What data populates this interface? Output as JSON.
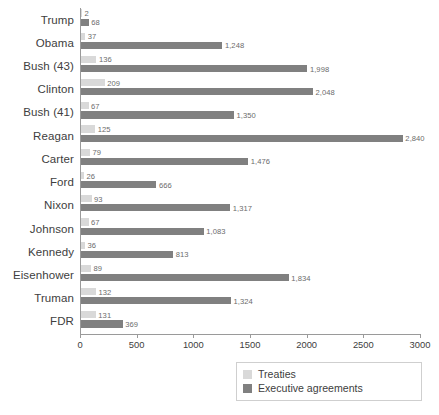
{
  "chart_data": {
    "type": "bar",
    "orientation": "horizontal",
    "title": "",
    "xlabel": "",
    "ylabel": "",
    "xlim": [
      0,
      3000
    ],
    "xticks": [
      0,
      500,
      1000,
      1500,
      2000,
      2500,
      3000
    ],
    "xtick_labels": [
      "0",
      "500",
      "1000",
      "1500",
      "2000",
      "2500",
      "3000"
    ],
    "grid": false,
    "legend_position": "bottom-right",
    "categories": [
      "Trump",
      "Obama",
      "Bush (43)",
      "Clinton",
      "Bush (41)",
      "Reagan",
      "Carter",
      "Ford",
      "Nixon",
      "Johnson",
      "Kennedy",
      "Eisenhower",
      "Truman",
      "FDR"
    ],
    "series": [
      {
        "name": "Treaties",
        "color": "#d9d9d9",
        "values": [
          2,
          37,
          136,
          209,
          67,
          125,
          79,
          26,
          93,
          67,
          36,
          89,
          132,
          131
        ],
        "labels": [
          "2",
          "37",
          "136",
          "209",
          "67",
          "125",
          "79",
          "26",
          "93",
          "67",
          "36",
          "89",
          "132",
          "131"
        ]
      },
      {
        "name": "Executive agreements",
        "color": "#808080",
        "values": [
          68,
          1248,
          1998,
          2048,
          1350,
          2840,
          1476,
          666,
          1317,
          1083,
          813,
          1834,
          1324,
          369
        ],
        "labels": [
          "68",
          "1,248",
          "1,998",
          "2,048",
          "1,350",
          "2,840",
          "1,476",
          "666",
          "1,317",
          "1,083",
          "813",
          "1,834",
          "1,324",
          "369"
        ]
      }
    ]
  },
  "legend": {
    "items": [
      {
        "label": "Treaties",
        "color": "#d9d9d9"
      },
      {
        "label": "Executive agreements",
        "color": "#808080"
      }
    ]
  }
}
